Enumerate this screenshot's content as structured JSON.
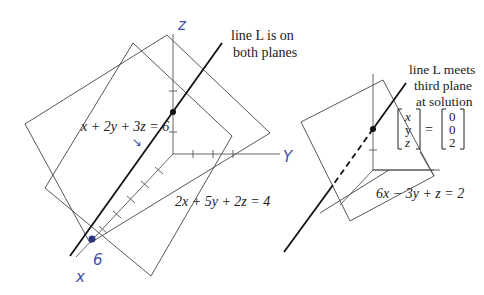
{
  "left_figure": {
    "axis_labels": {
      "z": "z",
      "y": "Y",
      "x": "x",
      "x_intercept": "6"
    },
    "caption": [
      "line L is on",
      "both planes"
    ],
    "caption_bold": "L",
    "plane1_equation": "x + 2y + 3z = 6",
    "plane2_equation": "2x + 5y + 2z = 4",
    "annotation_arrow": "↘"
  },
  "right_figure": {
    "caption": [
      "line L meets",
      "third plane",
      "at solution"
    ],
    "caption_bold": "L",
    "solution_vector": {
      "lhs": [
        "x",
        "y",
        "z"
      ],
      "equals": "=",
      "rhs": [
        "0",
        "0",
        "2"
      ]
    },
    "plane3_equation": "6x − 3y + z = 2"
  },
  "colors": {
    "ink": "#222222",
    "pen": "#3f4fa8",
    "background": "#ffffff"
  }
}
